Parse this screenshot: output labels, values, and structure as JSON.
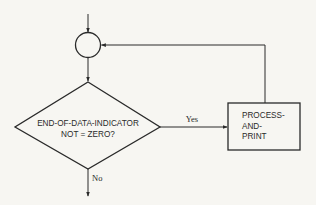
{
  "diagram": {
    "type": "flowchart",
    "nodes": {
      "connector": {
        "kind": "connector-circle",
        "label": ""
      },
      "decision": {
        "kind": "decision",
        "lines": [
          "END-OF-DATA-INDICATOR",
          "NOT = ZERO?"
        ]
      },
      "process": {
        "kind": "process",
        "lines": [
          "PROCESS-",
          "AND-",
          "PRINT"
        ]
      }
    },
    "edges": {
      "entry": {
        "from": "start",
        "to": "connector",
        "label": ""
      },
      "connector_to_decision": {
        "from": "connector",
        "to": "decision",
        "label": ""
      },
      "yes": {
        "from": "decision",
        "to": "process",
        "label": "Yes"
      },
      "no": {
        "from": "decision",
        "to": "exit",
        "label": "No"
      },
      "loop_back": {
        "from": "process",
        "to": "connector",
        "label": ""
      }
    },
    "colors": {
      "stroke": "#2a2a2a",
      "background": "#f7f6f2"
    }
  }
}
